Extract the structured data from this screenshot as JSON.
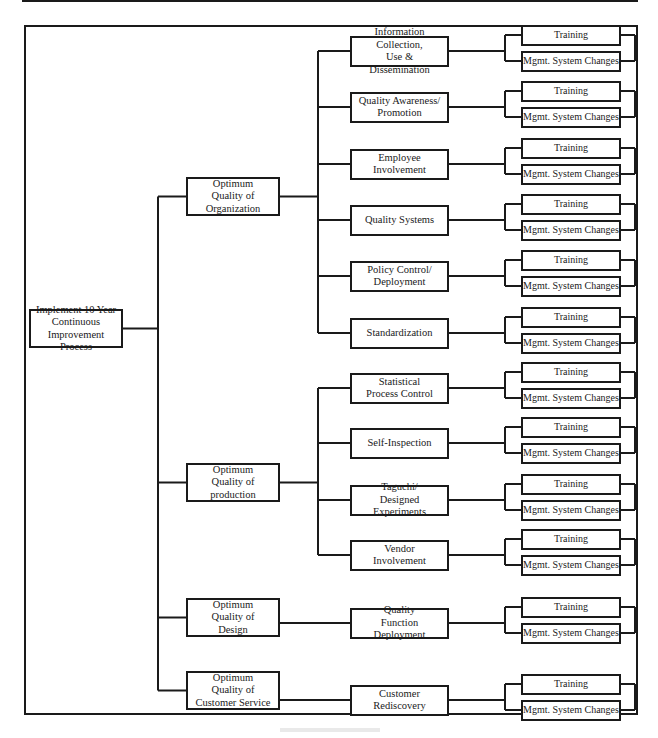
{
  "diagram": {
    "type": "tree",
    "orientation": "left-to-right",
    "root": {
      "label": "Implement 10 Year\nContinuous\nImprovement Process"
    },
    "branches": [
      {
        "label": "Optimum\nQuality of\nOrganization",
        "children": [
          {
            "label": "Information Collection,\nUse & Dissemination",
            "leaves": [
              "Training",
              "Mgmt. System Changes"
            ]
          },
          {
            "label": "Quality Awareness/\nPromotion",
            "leaves": [
              "Training",
              "Mgmt. System Changes"
            ]
          },
          {
            "label": "Employee\nInvolvement",
            "leaves": [
              "Training",
              "Mgmt. System Changes"
            ]
          },
          {
            "label": "Quality Systems",
            "leaves": [
              "Training",
              "Mgmt. System Changes"
            ]
          },
          {
            "label": "Policy Control/\nDeployment",
            "leaves": [
              "Training",
              "Mgmt. System Changes"
            ]
          },
          {
            "label": "Standardization",
            "leaves": [
              "Training",
              "Mgmt. System Changes"
            ]
          }
        ]
      },
      {
        "label": "Optimum\nQuality of\nproduction",
        "children": [
          {
            "label": "Statistical\nProcess Control",
            "leaves": [
              "Training",
              "Mgmt. System Changes"
            ]
          },
          {
            "label": "Self-Inspection",
            "leaves": [
              "Training",
              "Mgmt. System Changes"
            ]
          },
          {
            "label": "Taguchi/\nDesigned Experiments",
            "leaves": [
              "Training",
              "Mgmt. System Changes"
            ]
          },
          {
            "label": "Vendor\nInvolvement",
            "leaves": [
              "Training",
              "Mgmt. System Changes"
            ]
          }
        ]
      },
      {
        "label": "Optimum\nQuality of\nDesign",
        "children": [
          {
            "label": "Quality\nFunction Deployment",
            "leaves": [
              "Training",
              "Mgmt. System Changes"
            ]
          }
        ]
      },
      {
        "label": "Optimum\nQuality of\nCustomer Service",
        "children": [
          {
            "label": "Customer\nRediscovery",
            "leaves": [
              "Training",
              "Mgmt. System Changes"
            ]
          }
        ]
      }
    ]
  },
  "layout": {
    "root": {
      "x": 29,
      "y": 309,
      "w": 94,
      "h": 39
    },
    "l1_spine_x": 158,
    "l1_box": {
      "x": 186,
      "w": 94
    },
    "l1_y": [
      177,
      463,
      598,
      671
    ],
    "l1_h": 39,
    "l2_spine_x": 318,
    "l2_box": {
      "x": 350,
      "w": 99,
      "h": 31
    },
    "l2_center_y": [
      51,
      107,
      164,
      220,
      276,
      333,
      388,
      443,
      500,
      555,
      623,
      700
    ],
    "l3_spine_x": 505,
    "l3_box": {
      "x": 521,
      "w": 100,
      "h": 21
    },
    "l3_bracket_x": 635,
    "leaf_offsets": [
      -16,
      10
    ]
  },
  "colors": {
    "line": "#1a1a1a",
    "background": "#ffffff"
  }
}
